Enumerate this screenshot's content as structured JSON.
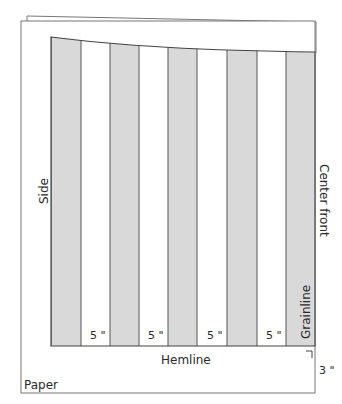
{
  "diagram": {
    "type": "sewing-pattern-slash-and-spread",
    "labels": {
      "side": "Side",
      "center_front": "Center front",
      "grainline": "Grainline",
      "hemline": "Hemline",
      "paper": "Paper",
      "hem_allowance": "3 \""
    },
    "spread_labels": [
      "5 \"",
      "5 \"",
      "5 \"",
      "5 \""
    ],
    "strips": [
      {
        "x": 51,
        "w": 30,
        "fill": "gray"
      },
      {
        "x": 81,
        "w": 29,
        "fill": "white"
      },
      {
        "x": 110,
        "w": 29,
        "fill": "gray"
      },
      {
        "x": 139,
        "w": 29,
        "fill": "white"
      },
      {
        "x": 168,
        "w": 29,
        "fill": "gray"
      },
      {
        "x": 197,
        "w": 30,
        "fill": "white"
      },
      {
        "x": 227,
        "w": 30,
        "fill": "gray"
      },
      {
        "x": 257,
        "w": 29,
        "fill": "white"
      },
      {
        "x": 286,
        "w": 29,
        "fill": "gray"
      }
    ],
    "colors": {
      "strip_gray": "#d9d9d9",
      "line": "#555555",
      "line_dark": "#333333",
      "text": "#2a2a2a"
    }
  }
}
